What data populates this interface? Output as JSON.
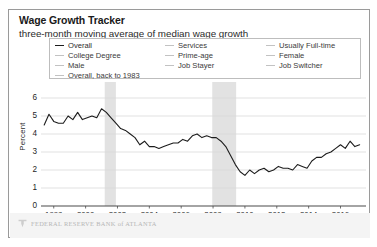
{
  "header": {
    "title": "Wage Growth Tracker",
    "subtitle": "three-month moving average of median wage growth"
  },
  "legend": {
    "columns": [
      {
        "items": [
          {
            "label": "Overall",
            "active": true
          },
          {
            "label": "College Degree",
            "active": false
          },
          {
            "label": "Male",
            "active": false
          },
          {
            "label": "Overall, back to 1983",
            "active": false
          }
        ]
      },
      {
        "items": [
          {
            "label": "Services",
            "active": false
          },
          {
            "label": "Prime-age",
            "active": false
          },
          {
            "label": "Job Stayer",
            "active": false
          }
        ]
      },
      {
        "items": [
          {
            "label": "Usually Full-time",
            "active": false
          },
          {
            "label": "Female",
            "active": false
          },
          {
            "label": "Job Switcher",
            "active": false
          }
        ]
      }
    ]
  },
  "footer": {
    "text": "FEDERAL RESERVE BANK of ATLANTA",
    "logo": "fed-atlanta-mark"
  },
  "colors": {
    "line": "#1c1c1c",
    "grid": "#d9d9d9",
    "axis": "#4a4a4a",
    "recession_band": "#e2e2e2",
    "legend_muted": "#c2c2c2",
    "card_border": "#9a9a9a",
    "footer_band": "#f4f4f4"
  },
  "chart_data": {
    "type": "line",
    "title": "Wage Growth Tracker",
    "subtitle": "three-month moving average of median wage growth",
    "xlabel": "",
    "ylabel": "Percent",
    "ylim": [
      0,
      6
    ],
    "yticks": [
      0,
      1,
      2,
      3,
      4,
      5,
      6
    ],
    "xlim": [
      1997.2,
      2017.6
    ],
    "xticks": [
      1998,
      2000,
      2002,
      2004,
      2006,
      2008,
      2010,
      2012,
      2014,
      2016
    ],
    "grid": true,
    "legend_position": "top",
    "annotations": [
      {
        "type": "recession_band",
        "label": "2001 recession",
        "x_start": 2001.2,
        "x_end": 2001.9
      },
      {
        "type": "recession_band",
        "label": "2007-2009 recession",
        "x_start": 2007.95,
        "x_end": 2009.45
      }
    ],
    "series": [
      {
        "name": "Overall",
        "color": "#1c1c1c",
        "visible": true,
        "x": [
          1997.4,
          1997.7,
          1998.0,
          1998.3,
          1998.6,
          1998.9,
          1999.2,
          1999.5,
          1999.8,
          2000.1,
          2000.4,
          2000.7,
          2001.0,
          2001.3,
          2001.6,
          2001.9,
          2002.2,
          2002.5,
          2002.8,
          2003.1,
          2003.4,
          2003.7,
          2004.0,
          2004.3,
          2004.6,
          2004.9,
          2005.2,
          2005.5,
          2005.8,
          2006.1,
          2006.4,
          2006.7,
          2007.0,
          2007.3,
          2007.6,
          2007.9,
          2008.2,
          2008.5,
          2008.8,
          2009.1,
          2009.4,
          2009.7,
          2010.0,
          2010.3,
          2010.6,
          2010.9,
          2011.2,
          2011.5,
          2011.8,
          2012.1,
          2012.4,
          2012.7,
          2013.0,
          2013.3,
          2013.6,
          2013.9,
          2014.2,
          2014.5,
          2014.8,
          2015.1,
          2015.4,
          2015.7,
          2016.0,
          2016.3,
          2016.6,
          2016.9,
          2017.2
        ],
        "y": [
          4.5,
          5.1,
          4.7,
          4.6,
          4.6,
          5.0,
          4.8,
          5.2,
          4.8,
          4.9,
          5.0,
          4.9,
          5.4,
          5.2,
          4.9,
          4.6,
          4.3,
          4.2,
          4.0,
          3.8,
          3.4,
          3.6,
          3.3,
          3.3,
          3.2,
          3.3,
          3.4,
          3.5,
          3.5,
          3.7,
          3.6,
          3.9,
          4.0,
          3.8,
          3.9,
          3.8,
          3.8,
          3.6,
          3.3,
          2.8,
          2.3,
          1.9,
          1.7,
          2.0,
          1.8,
          2.0,
          2.1,
          1.9,
          2.0,
          2.2,
          2.1,
          2.1,
          2.0,
          2.3,
          2.2,
          2.1,
          2.5,
          2.7,
          2.7,
          2.9,
          3.0,
          3.2,
          3.4,
          3.2,
          3.6,
          3.3,
          3.4
        ]
      },
      {
        "name": "College Degree",
        "color": "#c2c2c2",
        "visible": false
      },
      {
        "name": "Male",
        "color": "#c2c2c2",
        "visible": false
      },
      {
        "name": "Overall, back to 1983",
        "color": "#c2c2c2",
        "visible": false
      },
      {
        "name": "Services",
        "color": "#c2c2c2",
        "visible": false
      },
      {
        "name": "Prime-age",
        "color": "#c2c2c2",
        "visible": false
      },
      {
        "name": "Job Stayer",
        "color": "#c2c2c2",
        "visible": false
      },
      {
        "name": "Usually Full-time",
        "color": "#c2c2c2",
        "visible": false
      },
      {
        "name": "Female",
        "color": "#c2c2c2",
        "visible": false
      },
      {
        "name": "Job Switcher",
        "color": "#c2c2c2",
        "visible": false
      }
    ]
  }
}
